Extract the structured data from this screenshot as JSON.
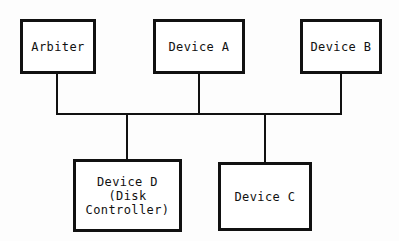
{
  "diagram": {
    "background_color": "#fdfdfd",
    "line_color": "#111111",
    "box_fill_color": "#ffffff",
    "nodes": [
      {
        "id": "arbiter",
        "label": "Arbiter",
        "row": "top"
      },
      {
        "id": "device-a",
        "label": "Device A",
        "row": "top"
      },
      {
        "id": "device-b",
        "label": "Device B",
        "row": "top"
      },
      {
        "id": "device-d",
        "label": "Device D\n(Disk\nController)",
        "row": "bottom"
      },
      {
        "id": "device-c",
        "label": "Device C",
        "row": "bottom"
      }
    ],
    "bus": {
      "name": "shared-bus",
      "orientation": "horizontal",
      "drops": [
        "arbiter",
        "device-a",
        "device-b",
        "device-d",
        "device-c"
      ]
    }
  }
}
